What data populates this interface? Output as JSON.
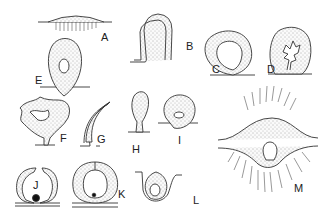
{
  "figure": {
    "panels": [
      {
        "id": "A",
        "label": "A",
        "description": "flat cell layer with bulge and striations"
      },
      {
        "id": "B",
        "label": "B",
        "description": "arched hollow tube"
      },
      {
        "id": "C",
        "label": "C",
        "description": "thick-walled vesicle with open lumen"
      },
      {
        "id": "D",
        "label": "D",
        "description": "vesicle with branched lumen"
      },
      {
        "id": "E",
        "label": "E",
        "description": "teardrop body with small central cavity"
      },
      {
        "id": "F",
        "label": "F",
        "description": "irregular lobed body on stalk"
      },
      {
        "id": "G",
        "label": "G",
        "description": "curved double-walled tube"
      },
      {
        "id": "H",
        "label": "H",
        "description": "club-shaped body on stalk"
      },
      {
        "id": "I",
        "label": "I",
        "description": "rounded body with small central cavity"
      },
      {
        "id": "J",
        "label": "J",
        "description": "split vesicle with dark granule"
      },
      {
        "id": "K",
        "label": "K",
        "description": "closed vesicle with dark granule"
      },
      {
        "id": "L",
        "label": "L",
        "description": "body within cup-shaped fold"
      },
      {
        "id": "M",
        "label": "M",
        "description": "spindle body with radiating fibers"
      }
    ],
    "colors": {
      "ink": "#333333",
      "fill": "#f4f4f4",
      "background": "#ffffff"
    }
  }
}
